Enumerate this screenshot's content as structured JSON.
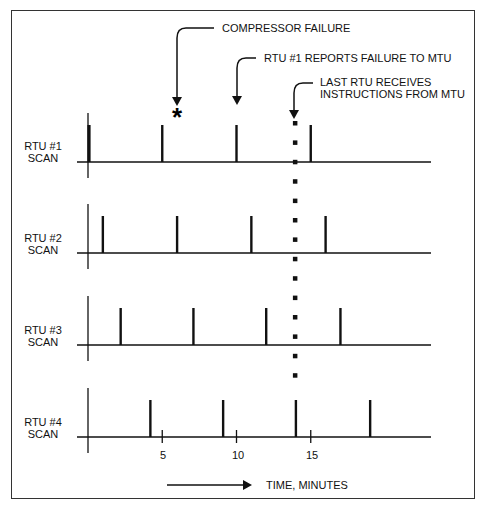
{
  "chart_data": {
    "type": "timing-diagram",
    "title": "",
    "xlabel": "TIME, MINUTES",
    "x_ticks": [
      5,
      10,
      15
    ],
    "xlim": [
      0,
      23
    ],
    "rows": [
      {
        "name": "RTU #1",
        "label_line1": "RTU #1",
        "label_line2": "SCAN",
        "scans": [
          0,
          5,
          10,
          15
        ],
        "first_thick": true
      },
      {
        "name": "RTU #2",
        "label_line1": "RTU #2",
        "label_line2": "SCAN",
        "scans": [
          1,
          6,
          11,
          16
        ]
      },
      {
        "name": "RTU #3",
        "label_line1": "RTU #3",
        "label_line2": "SCAN",
        "scans": [
          2.2,
          7.1,
          12,
          17
        ]
      },
      {
        "name": "RTU #4",
        "label_line1": "RTU #4",
        "label_line2": "SCAN",
        "scans": [
          4.2,
          9.1,
          14,
          19
        ]
      }
    ],
    "events": [
      {
        "label": "COMPRESSOR FAILURE",
        "time": 6,
        "marker": "*"
      },
      {
        "label": "RTU #1 REPORTS FAILURE TO MTU",
        "time": 10
      },
      {
        "label_lines": [
          "LAST RTU RECEIVES",
          "INSTRUCTIONS FROM MTU"
        ],
        "time": 14,
        "dotted_line": true
      }
    ]
  },
  "labels": {
    "event1": "COMPRESSOR FAILURE",
    "event2": "RTU #1 REPORTS FAILURE TO MTU",
    "event3_line1": "LAST RTU RECEIVES",
    "event3_line2": "INSTRUCTIONS FROM MTU",
    "asterisk": "*",
    "rtu1_l1": "RTU #1",
    "rtu1_l2": "SCAN",
    "rtu2_l1": "RTU #2",
    "rtu2_l2": "SCAN",
    "rtu3_l1": "RTU #3",
    "rtu3_l2": "SCAN",
    "rtu4_l1": "RTU #4",
    "rtu4_l2": "SCAN",
    "tick5": "5",
    "tick10": "10",
    "tick15": "15",
    "time_axis": "TIME, MINUTES"
  },
  "colors": {
    "ink": "#111111",
    "frame": "#333333",
    "background": "#ffffff"
  }
}
